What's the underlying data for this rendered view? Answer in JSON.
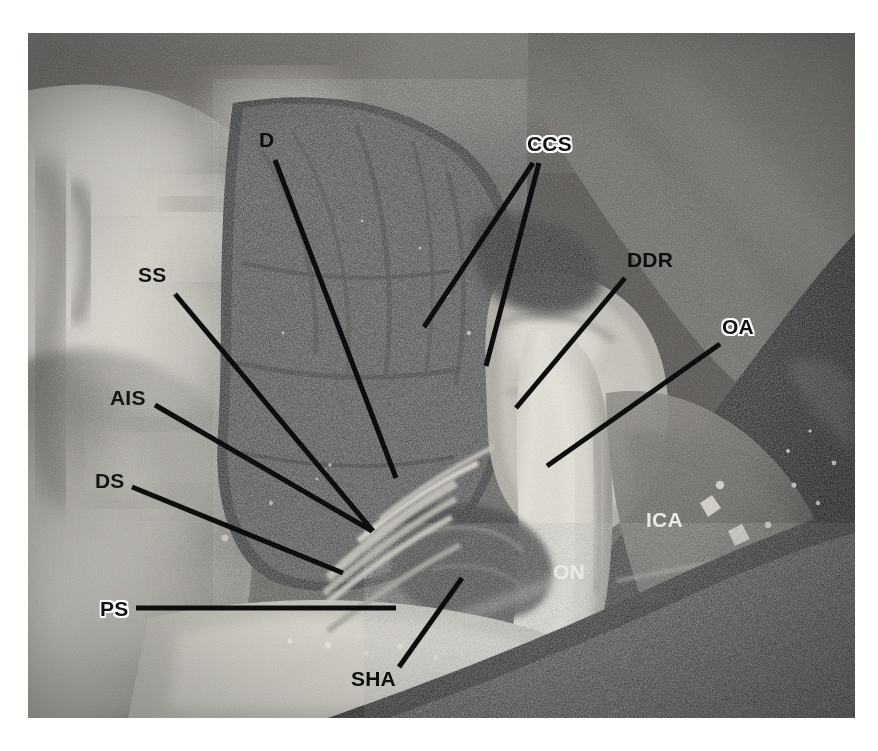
{
  "figure": {
    "kind": "anatomical-dissection-photograph",
    "canvas": {
      "width": 878,
      "height": 751,
      "background": "#ffffff"
    },
    "photo": {
      "left": 28,
      "top": 33,
      "width": 827,
      "height": 685
    }
  },
  "palette": {
    "background": "#ffffff",
    "leader_line": "#0d0d0d",
    "label_text": "#101010",
    "label_halo": "#ffffff",
    "bone_bright": "#d9d6cf",
    "bone_mid": "#a7a49d",
    "soft_tissue": "#8e8b85",
    "cavity_dark": "#201f1e",
    "deep_shadow": "#0b0b0b",
    "nerve_pale": "#cfccc4"
  },
  "labels": [
    {
      "id": "d",
      "text": "D",
      "full_name": "Dura",
      "style": "plain",
      "x": 259,
      "y": 129,
      "leader": {
        "x1": 275,
        "y1": 160,
        "x2": 396,
        "y2": 478
      }
    },
    {
      "id": "ccs",
      "text": "CCS",
      "full_name": "Carotid cave segment",
      "style": "halo",
      "x": 527,
      "y": 133,
      "leaders": [
        {
          "x1": 533,
          "y1": 163,
          "x2": 424,
          "y2": 327
        },
        {
          "x1": 539,
          "y1": 163,
          "x2": 486,
          "y2": 366
        }
      ]
    },
    {
      "id": "ss",
      "text": "SS",
      "full_name": "Sphenoid sinus",
      "style": "plain",
      "x": 138,
      "y": 264,
      "leader": {
        "x1": 175,
        "y1": 294,
        "x2": 373,
        "y2": 531
      }
    },
    {
      "id": "ddr",
      "text": "DDR",
      "full_name": "Distal dural ring",
      "style": "plain",
      "x": 627,
      "y": 249,
      "leader": {
        "x1": 625,
        "y1": 278,
        "x2": 516,
        "y2": 408
      }
    },
    {
      "id": "oa",
      "text": "OA",
      "full_name": "Ophthalmic artery",
      "style": "halo",
      "x": 722,
      "y": 316,
      "leader": {
        "x1": 720,
        "y1": 344,
        "x2": 547,
        "y2": 466
      }
    },
    {
      "id": "ais",
      "text": "AIS",
      "full_name": "Anterior intercavernous sinus",
      "style": "plain",
      "x": 110,
      "y": 387,
      "leader": {
        "x1": 155,
        "y1": 405,
        "x2": 372,
        "y2": 531
      }
    },
    {
      "id": "ds",
      "text": "DS",
      "full_name": "Diaphragma sellae",
      "style": "plain",
      "x": 95,
      "y": 470,
      "leader": {
        "x1": 132,
        "y1": 487,
        "x2": 343,
        "y2": 573
      }
    },
    {
      "id": "ica",
      "text": "ICA",
      "full_name": "Internal carotid artery",
      "style": "ondark",
      "x": 646,
      "y": 509,
      "leader": null
    },
    {
      "id": "on",
      "text": "ON",
      "full_name": "Optic nerve",
      "style": "ondark",
      "x": 553,
      "y": 561,
      "leader": null
    },
    {
      "id": "ps",
      "text": "PS",
      "full_name": "Planum sphenoidale",
      "style": "halo",
      "x": 100,
      "y": 598,
      "leader": {
        "x1": 136,
        "y1": 608,
        "x2": 396,
        "y2": 608
      }
    },
    {
      "id": "sha",
      "text": "SHA",
      "full_name": "Superior hypophyseal artery",
      "style": "plain",
      "x": 351,
      "y": 668,
      "leader": {
        "x1": 399,
        "y1": 667,
        "x2": 462,
        "y2": 578
      }
    }
  ]
}
